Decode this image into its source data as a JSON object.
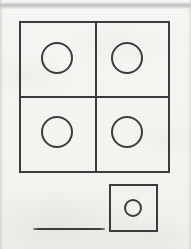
{
  "document": {
    "kind": "scanned-worksheet-fragment",
    "page_width": 191,
    "page_height": 249,
    "background_color": "#f5f4f2",
    "ink_color": "#3c3c3e",
    "scan_band_color": "#c4c3c1",
    "visible_text": ""
  },
  "figures": {
    "grid_square": {
      "label": "large square divided into four equal cells",
      "x": 19,
      "y": 21,
      "width": 151,
      "height": 152,
      "rows": 2,
      "columns": 2,
      "cell_count": 4,
      "stroke_width": 2,
      "stroke_color": "#3c3c3e",
      "fill": "none",
      "divider_x": 95,
      "divider_y": 96,
      "cells": [
        {
          "name": "top-left-cell",
          "circle": true,
          "circle_cx": 57,
          "circle_cy": 58,
          "circle_r": 16
        },
        {
          "name": "top-right-cell",
          "circle": true,
          "circle_cx": 127,
          "circle_cy": 58,
          "circle_r": 16
        },
        {
          "name": "bottom-left-cell",
          "circle": true,
          "circle_cx": 57,
          "circle_cy": 132,
          "circle_r": 16
        },
        {
          "name": "bottom-right-cell",
          "circle": true,
          "circle_cx": 127,
          "circle_cy": 132,
          "circle_r": 16
        }
      ]
    },
    "single_square": {
      "label": "small single square containing one circle",
      "x": 109,
      "y": 184,
      "width": 49,
      "height": 48,
      "stroke_width": 2,
      "stroke_color": "#3c3c3e",
      "fill": "none",
      "circle_cx": 133,
      "circle_cy": 208,
      "circle_r": 9
    },
    "answer_rule": {
      "label": "blank answer line",
      "x": 33,
      "y": 228,
      "width": 72,
      "height": 2,
      "color": "#3c3c3e"
    },
    "scan_band": {
      "label": "grey horizontal scanning artifact band",
      "x": 0,
      "y": 2,
      "width": 191,
      "height": 7,
      "color": "#c4c3c1"
    }
  },
  "chart_data": {
    "type": "diagram",
    "title": "",
    "groups": [
      {
        "name": "grid-of-four",
        "squares": 4,
        "circles_per_square": 1,
        "total_circles": 4
      },
      {
        "name": "single-unit",
        "squares": 1,
        "circles_per_square": 1,
        "total_circles": 1
      }
    ],
    "annotations": []
  }
}
